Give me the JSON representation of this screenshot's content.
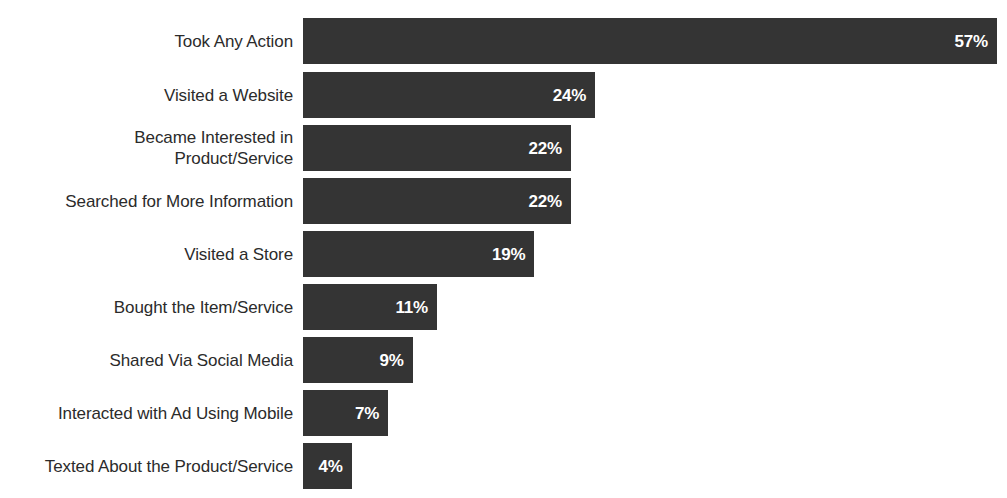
{
  "chart_data": {
    "type": "bar",
    "orientation": "horizontal",
    "title": "",
    "subtitle": "",
    "xlabel": "",
    "ylabel": "",
    "xlim": [
      0,
      57
    ],
    "grid": false,
    "legend": false,
    "value_suffix": "%",
    "categories": [
      "Took Any Action",
      "Visited a Website",
      "Became Interested in\nProduct/Service",
      "Searched for More Information",
      "Visited a Store",
      "Bought the Item/Service",
      "Shared Via Social Media",
      "Interacted with Ad Using Mobile",
      "Texted About the Product/Service"
    ],
    "values": [
      57,
      24,
      22,
      22,
      19,
      11,
      9,
      7,
      4
    ],
    "value_labels": [
      "57%",
      "24%",
      "22%",
      "22%",
      "19%",
      "11%",
      "9%",
      "7%",
      "4%"
    ],
    "colors": {
      "bar": "#343434",
      "value_text": "#ffffff",
      "category_text": "#2b2b2b",
      "background": "#ffffff"
    }
  }
}
